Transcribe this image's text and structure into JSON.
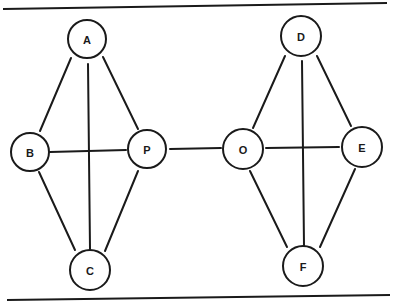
{
  "diagram": {
    "type": "graph",
    "colors": {
      "stroke": "#1a1a1a",
      "background": "#ffffff"
    },
    "rules": {
      "top": {
        "x1": 3,
        "y1": 9,
        "x2": 387,
        "y2": 3
      },
      "bottom": {
        "x1": 7,
        "y1": 300,
        "x2": 390,
        "y2": 295
      }
    },
    "nodes": [
      {
        "id": "A",
        "label": "A",
        "x": 87,
        "y": 39,
        "r": 19
      },
      {
        "id": "B",
        "label": "B",
        "x": 30,
        "y": 152,
        "r": 19
      },
      {
        "id": "P",
        "label": "P",
        "x": 147,
        "y": 149,
        "r": 19
      },
      {
        "id": "C",
        "label": "C",
        "x": 90,
        "y": 270,
        "r": 20
      },
      {
        "id": "O",
        "label": "O",
        "x": 243,
        "y": 149,
        "r": 20
      },
      {
        "id": "D",
        "label": "D",
        "x": 301,
        "y": 36,
        "r": 20
      },
      {
        "id": "E",
        "label": "E",
        "x": 362,
        "y": 147,
        "r": 20
      },
      {
        "id": "F",
        "label": "F",
        "x": 303,
        "y": 266,
        "r": 20
      }
    ],
    "edges": [
      {
        "from": "A",
        "to": "B",
        "x1": 71,
        "y1": 58,
        "x2": 40,
        "y2": 131
      },
      {
        "from": "A",
        "to": "P",
        "x1": 103,
        "y1": 57,
        "x2": 138,
        "y2": 129
      },
      {
        "from": "A",
        "to": "C",
        "x1": 88,
        "y1": 64,
        "x2": 90,
        "y2": 249
      },
      {
        "from": "B",
        "to": "P",
        "x1": 50,
        "y1": 152,
        "x2": 126,
        "y2": 150
      },
      {
        "from": "B",
        "to": "C",
        "x1": 39,
        "y1": 172,
        "x2": 75,
        "y2": 250
      },
      {
        "from": "P",
        "to": "C",
        "x1": 138,
        "y1": 171,
        "x2": 105,
        "y2": 251
      },
      {
        "from": "P",
        "to": "O",
        "x1": 170,
        "y1": 149,
        "x2": 221,
        "y2": 148
      },
      {
        "from": "D",
        "to": "O",
        "x1": 285,
        "y1": 56,
        "x2": 253,
        "y2": 128
      },
      {
        "from": "D",
        "to": "E",
        "x1": 317,
        "y1": 56,
        "x2": 351,
        "y2": 126
      },
      {
        "from": "D",
        "to": "F",
        "x1": 302,
        "y1": 61,
        "x2": 304,
        "y2": 246
      },
      {
        "from": "O",
        "to": "E",
        "x1": 266,
        "y1": 148,
        "x2": 339,
        "y2": 147
      },
      {
        "from": "O",
        "to": "F",
        "x1": 250,
        "y1": 171,
        "x2": 287,
        "y2": 247
      },
      {
        "from": "E",
        "to": "F",
        "x1": 355,
        "y1": 169,
        "x2": 320,
        "y2": 247
      }
    ]
  }
}
